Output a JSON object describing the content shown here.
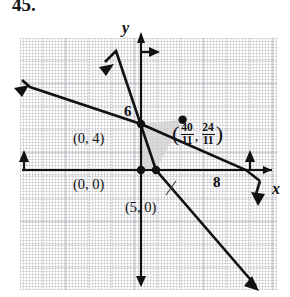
{
  "problem": {
    "number": "45."
  },
  "graph": {
    "axes": {
      "x_label": "x",
      "y_label": "y",
      "origin_px": {
        "x": 141,
        "y": 156
      },
      "unit_px": 23
    },
    "ticks": [
      {
        "name": "y-intercept-6",
        "text": "6",
        "axis": "y",
        "value": 6
      },
      {
        "name": "x-intercept-8",
        "text": "8",
        "axis": "x",
        "value": 8
      }
    ],
    "vertices": [
      {
        "name": "origin",
        "label": "(0, 0)",
        "x": 0,
        "y": 0
      },
      {
        "name": "y-intercept-4",
        "label": "(0, 4)",
        "x": 0,
        "y": 4
      },
      {
        "name": "x-intercept-5",
        "label": "(5, 0)",
        "x": 5,
        "y": 0
      },
      {
        "name": "intersection",
        "label_numer_x": "40",
        "label_denom_x": "11",
        "label_numer_y": "24",
        "label_denom_y": "11",
        "open_paren": "(",
        "comma": ",",
        "close_paren": ")"
      }
    ],
    "lines": [
      {
        "name": "steep-line",
        "description": "line through (0,6) and (5,0)"
      },
      {
        "name": "shallow-line",
        "description": "line through (0,4) and (8,0)"
      }
    ],
    "shaded_region": {
      "name": "feasible-region",
      "fill": "#cfcfcf"
    },
    "colors": {
      "ink": "#111111",
      "grid": "#a0a0aa",
      "shade": "#cfcfcf",
      "background": "#ffffff"
    }
  }
}
